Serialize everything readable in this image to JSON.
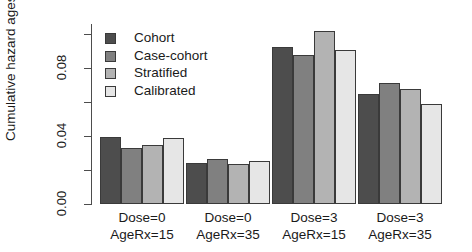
{
  "chart_data": {
    "type": "bar",
    "title": "",
    "xlabel": "",
    "ylabel": "Cumulative hazard ages 40-60 yrs",
    "ylim": [
      0.0,
      0.108
    ],
    "grid": false,
    "legend_position": "top-left-inside",
    "ytick_labels": [
      "0.00",
      "0.04",
      "0.08"
    ],
    "ytick_values": [
      0.0,
      0.04,
      0.08
    ],
    "minor_ytick_values": [
      0.02,
      0.06,
      0.1
    ],
    "categories": [
      "Dose=0\nAgeRx=15",
      "Dose=0\nAgeRx=35",
      "Dose=3\nAgeRx=15",
      "Dose=3\nAgeRx=35"
    ],
    "category_lines": [
      [
        "Dose=0",
        "AgeRx=15"
      ],
      [
        "Dose=0",
        "AgeRx=35"
      ],
      [
        "Dose=3",
        "AgeRx=15"
      ],
      [
        "Dose=3",
        "AgeRx=35"
      ]
    ],
    "series": [
      {
        "name": "Cohort",
        "color": "#4d4d4d",
        "values": [
          0.0394,
          0.0241,
          0.0924,
          0.0647
        ]
      },
      {
        "name": "Case-cohort",
        "color": "#808080",
        "values": [
          0.0329,
          0.0265,
          0.0876,
          0.0712
        ]
      },
      {
        "name": "Stratified",
        "color": "#b3b3b3",
        "values": [
          0.0347,
          0.0235,
          0.1018,
          0.0676
        ]
      },
      {
        "name": "Calibrated",
        "color": "#e6e6e6",
        "values": [
          0.0388,
          0.0253,
          0.0906,
          0.0588
        ]
      }
    ]
  },
  "axis": {
    "y_label": "Cumulative hazard ages 40-60 yrs",
    "tick_0": "0.00",
    "tick_1": "0.04",
    "tick_2": "0.08"
  },
  "legend": {
    "items": [
      {
        "label": "Cohort"
      },
      {
        "label": "Case-cohort"
      },
      {
        "label": "Stratified"
      },
      {
        "label": "Calibrated"
      }
    ]
  },
  "groups": [
    {
      "line1": "Dose=0",
      "line2": "AgeRx=15"
    },
    {
      "line1": "Dose=0",
      "line2": "AgeRx=35"
    },
    {
      "line1": "Dose=3",
      "line2": "AgeRx=15"
    },
    {
      "line1": "Dose=3",
      "line2": "AgeRx=35"
    }
  ]
}
